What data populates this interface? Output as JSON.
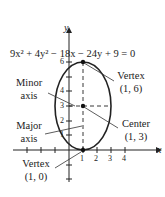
{
  "equation": {
    "text": "9x² + 4y² − 18x − 24y + 9 = 0"
  },
  "axes": {
    "x_label": "x",
    "y_label": "y"
  },
  "x_ticks": [
    "1",
    "2",
    "3",
    "4"
  ],
  "y_ticks": [
    "1",
    "2",
    "3",
    "4",
    "6"
  ],
  "labels": {
    "minor_axis_line1": "Minor",
    "minor_axis_line2": "axis",
    "major_axis_line1": "Major",
    "major_axis_line2": "axis",
    "top_vertex_name": "Vertex",
    "top_vertex_coords": "(1, 6)",
    "center_name": "Center",
    "center_coords": "(1, 3)",
    "bottom_vertex_name": "Vertex",
    "bottom_vertex_coords": "(1, 0)"
  },
  "ellipse": {
    "center": [
      1,
      3
    ],
    "semi_major": 3,
    "semi_minor": 2,
    "orientation": "vertical"
  }
}
